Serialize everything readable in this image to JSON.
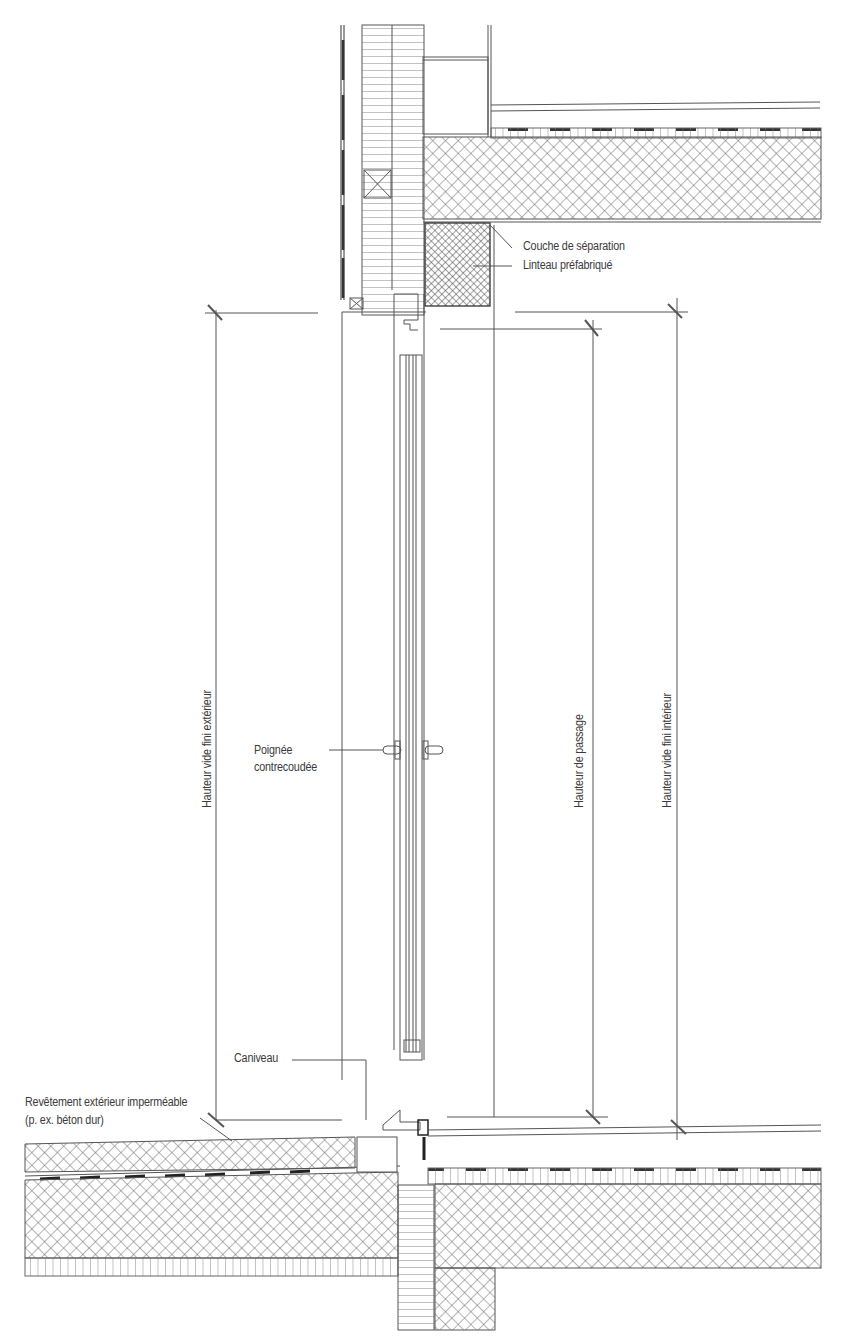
{
  "diagram": {
    "type": "architectural-section",
    "colors": {
      "line": "#555555",
      "hatch": "#666666",
      "text": "#3a3a3a",
      "background": "#ffffff"
    }
  },
  "annotations": {
    "couche_separation": "Couche de séparation",
    "linteau": "Linteau préfabriqué",
    "poignee_line1": "Poignée",
    "poignee_line2": "contrecoudée",
    "revetement_line1": "Revêtement extérieur imperméable",
    "revetement_line2": "(p. ex. béton dur)",
    "caniveau": "Caniveau"
  },
  "dimensions": [
    {
      "id": "ext",
      "label": "Hauteur vide fini extérieur"
    },
    {
      "id": "passage",
      "label": "Hauteur de passage"
    },
    {
      "id": "int",
      "label": "Hauteur vide fini intérieur"
    }
  ]
}
